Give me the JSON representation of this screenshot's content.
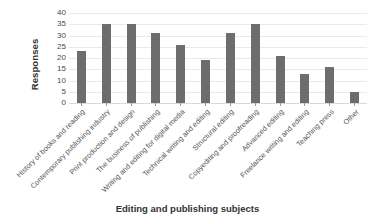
{
  "chart_data": {
    "type": "bar",
    "title": "",
    "xlabel": "Editing and publishing subjects",
    "ylabel": "Responses",
    "ylim": [
      0,
      40
    ],
    "yticks": [
      40,
      35,
      30,
      25,
      20,
      15,
      10,
      5,
      0
    ],
    "grid": true,
    "legend": "none",
    "bar_color": "#6d6d6d",
    "categories": [
      "History of books and reading",
      "Contemporary publishing industry",
      "Print production and design",
      "The business of publishing",
      "Writing and editing for digital media",
      "Technical writing and editing",
      "Structural editing",
      "Copyediting and proofreading",
      "Advanced editing",
      "Freelance writing and editing",
      "Teaching press",
      "Other"
    ],
    "values": [
      23,
      35,
      35,
      31,
      26,
      19,
      31,
      35,
      21,
      13,
      16,
      5
    ]
  }
}
